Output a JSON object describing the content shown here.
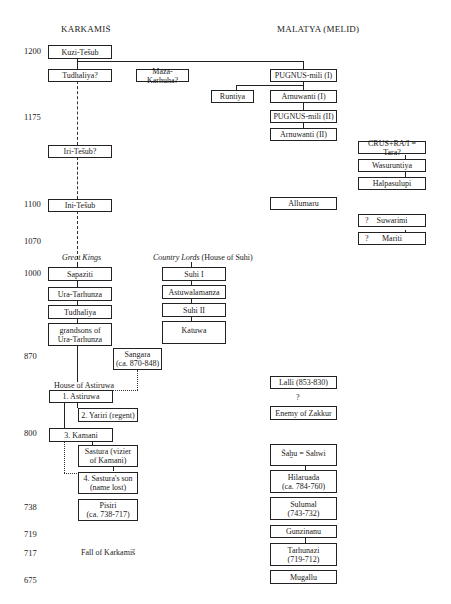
{
  "headers": {
    "left": "KARKAMIŠ",
    "right": "MALATYA (MELID)"
  },
  "years": [
    "1200",
    "1175",
    "1100",
    "1070",
    "1000",
    "870",
    "800",
    "738",
    "719",
    "717",
    "675"
  ],
  "group_labels": {
    "great_kings": "Great Kings",
    "country_lords": "Country Lords",
    "country_lords_suffix": " (House of Suhi)",
    "house_of_astiruwa": "House of Astiruwa",
    "fall_of_karkamis": "Fall of Karkamiš",
    "unknown_between_lalli_enemy": "?"
  },
  "karkamis": {
    "kuzi_teshub": "Kuzi-Tešub",
    "tudhaliya_q": "Tudhaliya?",
    "ini_teshub_q": "Iri-Tešub?",
    "ini_teshub": "Ini-Tešub",
    "sapaziti": "Sapaziti",
    "ura_tarhunza": "Ura-Tarhunza",
    "tudhaliya": "Tudhaliya",
    "grandsons": "grandsons of\nUra-Tarhunza",
    "sangara": "Sangara\n(ca. 870-848)",
    "astiruwa": "1. Astiruwa",
    "yariri": "2. Yariri (regent)",
    "kamani": "3. Kamani",
    "sastura": "Sastura (vizier\nof Kamani)",
    "sastura_son": "4. Sastura's son\n(name lost)",
    "pisiri": "Pisiri\n(ca. 738-717)"
  },
  "other": {
    "maza_karhuha": "Maza-Karhuha?"
  },
  "suhi": {
    "suhi_1": "Suhi I",
    "astuwalamanza": "Astuwalamanza",
    "suhi_2": "Suhi II",
    "katuwa": "Katuwa"
  },
  "malatya": {
    "pugnus_mili_1": "PUGNUS-mili (I)",
    "runtiya": "Runtiya",
    "arnuwanti_1": "Arnuwanti (I)",
    "pugnus_mili_2": "PUGNUS-mili (II)",
    "arnuwanti_2": "Arnuwanti (II)",
    "allumaru": "Allumaru",
    "lalli": "Lalli (853-830)",
    "enemy_of_zakkur": "Enemy of Zakkur",
    "sahu": "Šaḫu = Sahwi",
    "hilaruada": "Hilaruada\n(ca. 784-760)",
    "sulumal": "Sulumal\n(743-732)",
    "gunzinanu": "Gunzinanu",
    "tarhunazi": "Tarhunazi\n(719-712)",
    "mugallu": "Mugallu"
  },
  "far_right": {
    "crus_rai": "CRUS+RA/I = Tara?",
    "wasuruntiya": "Wasuruntiya",
    "halpasulupi": "Halpasulupi",
    "suwarimi": "Suwarimi",
    "mariti": "Mariti",
    "q_mark": "?"
  }
}
